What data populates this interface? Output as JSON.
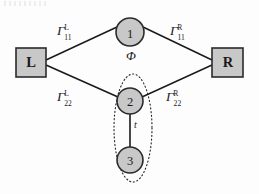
{
  "figure": {
    "background_color": "#fdfdfd",
    "node_fill_color": "#c8c8c8",
    "node_stroke_color": "#2b2b2b",
    "line_color": "#1a1a1a",
    "dotted_outline_color": "#2b2b2b"
  },
  "terminals": [
    {
      "id": "left-lead",
      "label": "L",
      "x": 31,
      "y": 62
    },
    {
      "id": "right-lead",
      "label": "R",
      "x": 228,
      "y": 62
    }
  ],
  "nodes": [
    {
      "id": "dot-1",
      "label": "1",
      "x": 130,
      "y": 32,
      "r": 14
    },
    {
      "id": "dot-2",
      "label": "2",
      "x": 130,
      "y": 101,
      "r": 13
    },
    {
      "id": "dot-3",
      "label": "3",
      "x": 130,
      "y": 160,
      "r": 13
    }
  ],
  "edges": [
    {
      "id": "edge-left-upper",
      "from": "left-lead",
      "to": "dot-1",
      "style": "solid"
    },
    {
      "id": "edge-right-upper",
      "from": "dot-1",
      "to": "right-lead",
      "style": "solid"
    },
    {
      "id": "edge-left-lower",
      "from": "left-lead",
      "to": "dot-2",
      "style": "solid"
    },
    {
      "id": "edge-right-lower",
      "from": "dot-2",
      "to": "right-lead",
      "style": "solid"
    },
    {
      "id": "edge-interdot",
      "from": "dot-2",
      "to": "dot-3",
      "style": "solid"
    }
  ],
  "labels": {
    "gamma_left_upper": {
      "symbol": "Γ",
      "superscript": "L",
      "subscript": "11",
      "x": 57,
      "y": 24
    },
    "gamma_right_upper": {
      "symbol": "Γ",
      "superscript": "R",
      "subscript": "11",
      "x": 170,
      "y": 24
    },
    "gamma_left_lower": {
      "symbol": "Γ",
      "superscript": "L",
      "subscript": "22",
      "x": 57,
      "y": 90
    },
    "gamma_right_lower": {
      "symbol": "Γ",
      "superscript": "R",
      "subscript": "22",
      "x": 166,
      "y": 90
    },
    "flux": {
      "text": "Φ",
      "x": 126,
      "y": 55
    },
    "hopping": {
      "text": "t",
      "x": 134,
      "y": 122
    }
  },
  "grouping_outline": {
    "id": "dot-pair-outline",
    "shape": "ellipse",
    "cx": 133,
    "cy": 128,
    "rx": 19,
    "ry": 54,
    "stroke_style": "dotted",
    "encloses": [
      "dot-2",
      "dot-3"
    ]
  }
}
